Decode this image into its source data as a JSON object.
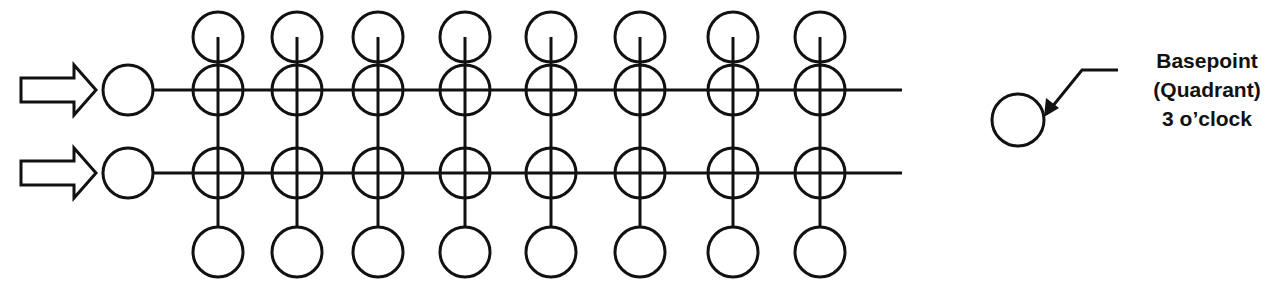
{
  "diagram": {
    "stroke_color": "#111111",
    "background": "#ffffff",
    "columns_x": [
      218,
      297,
      378,
      465,
      551,
      640,
      733,
      820
    ],
    "rows": [
      {
        "y": 90,
        "label": "row-1"
      },
      {
        "y": 173,
        "label": "row-2"
      }
    ],
    "top_circle_y": 37,
    "bottom_circle_y": 252,
    "circle_radius": 25,
    "input_arrows": 2,
    "line_end_x": 902
  },
  "callout": {
    "line1": "Basepoint",
    "line2": "(Quadrant)",
    "line3": "3 o’clock"
  }
}
